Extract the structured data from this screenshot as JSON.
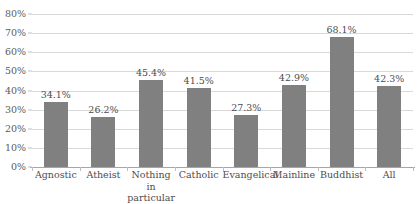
{
  "chart_data": {
    "type": "bar",
    "title": "",
    "title_cropped": true,
    "xlabel": "",
    "ylabel": "",
    "ylim": [
      0,
      80
    ],
    "ytick_step": 10,
    "grid": true,
    "legend": "none",
    "orientation": "vertical",
    "bar_color": "#808080",
    "gridline_color": "#d9d9d9",
    "axis_color": "#a6a6a6",
    "value_suffix": "%",
    "categories": [
      "Agnostic",
      "Atheist",
      "Nothing in particular",
      "Catholic",
      "Evangelical",
      "Mainline",
      "Buddhist",
      "All"
    ],
    "category_lines": [
      [
        "Agnostic"
      ],
      [
        "Atheist"
      ],
      [
        "Nothing in",
        "particular"
      ],
      [
        "Catholic"
      ],
      [
        "Evangelical"
      ],
      [
        "Mainline"
      ],
      [
        "Buddhist"
      ],
      [
        "All"
      ]
    ],
    "values": [
      34.1,
      26.2,
      45.4,
      41.5,
      27.3,
      42.9,
      68.1,
      42.3
    ],
    "data_labels": [
      "34.1%",
      "26.2%",
      "45.4%",
      "41.5%",
      "27.3%",
      "42.9%",
      "68.1%",
      "42.3%"
    ],
    "ytick_labels": [
      "80%",
      "70%",
      "60%",
      "50%",
      "40%",
      "30%",
      "20%",
      "10%",
      "0%"
    ],
    "ytick_values": [
      80,
      70,
      60,
      50,
      40,
      30,
      20,
      10,
      0
    ]
  }
}
